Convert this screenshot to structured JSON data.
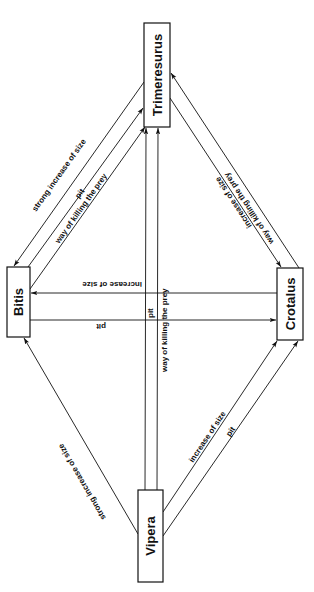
{
  "diagram": {
    "nodes": {
      "trimeresurus": {
        "label": "Trimeresurus"
      },
      "bitis": {
        "label": "Bitis"
      },
      "crotalus": {
        "label": "Crotalus"
      },
      "vipera": {
        "label": "Vipera"
      }
    },
    "edges": {
      "trim_to_bitis_size": {
        "from": "Trimeresurus",
        "to": "Bitis",
        "label": "strong increase of size"
      },
      "bitis_to_trim_pit": {
        "from": "Bitis",
        "to": "Trimeresurus",
        "label": "pit"
      },
      "bitis_to_trim_kill": {
        "from": "Bitis",
        "to": "Trimeresurus",
        "label": "way of killing the prey"
      },
      "crot_to_trim_kill": {
        "from": "Crotalus",
        "to": "Trimeresurus",
        "label": "way of killing the prey"
      },
      "trim_to_crot_size": {
        "from": "Trimeresurus",
        "to": "Crotalus",
        "label": "increase of size"
      },
      "crot_to_bitis_size": {
        "from": "Crotalus",
        "to": "Bitis",
        "label": "increase of size"
      },
      "bitis_to_crot_pit": {
        "from": "Bitis",
        "to": "Crotalus",
        "label": "pit"
      },
      "vipera_to_bitis_size": {
        "from": "Vipera",
        "to": "Bitis",
        "label": "strong increase of size"
      },
      "vipera_to_crot_size": {
        "from": "Vipera",
        "to": "Crotalus",
        "label": "increase of size"
      },
      "vipera_to_crot_pit": {
        "from": "Vipera",
        "to": "Crotalus",
        "label": "pit"
      },
      "vipera_to_trim_pit": {
        "from": "Vipera",
        "to": "Trimeresurus",
        "label": "pit"
      },
      "vipera_to_trim_kill": {
        "from": "Vipera",
        "to": "Trimeresurus",
        "label": "way of killing the prey"
      }
    }
  }
}
